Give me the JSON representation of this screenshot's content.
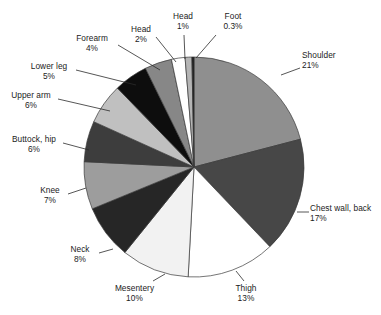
{
  "chart_data": {
    "type": "pie",
    "title": "",
    "subtitle": "",
    "xlabel": "",
    "ylabel": "",
    "legend_position": "none",
    "grid": false,
    "value_unit": "%",
    "start_angle_deg": 0,
    "direction": "clockwise",
    "categories": [
      "Shoulder",
      "Chest wall, back",
      "Thigh",
      "Mesentery",
      "Neck",
      "Knee",
      "Buttock, hip",
      "Upper arm",
      "Lower leg",
      "Forearm",
      "Head",
      "Head",
      "Foot"
    ],
    "values": [
      21,
      17,
      13,
      10,
      8,
      7,
      6,
      6,
      5,
      4,
      2,
      1,
      0.3
    ],
    "value_labels": [
      "21%",
      "17%",
      "13%",
      "10%",
      "8%",
      "7%",
      "6%",
      "6%",
      "5%",
      "4%",
      "2%",
      "1%",
      "0.3%"
    ],
    "colors": [
      "#8f8f8f",
      "#474747",
      "#ffffff",
      "#f2f2f2",
      "#262626",
      "#9d9d9d",
      "#3d3d3d",
      "#c0c0c0",
      "#0d0d0d",
      "#878787",
      "#ffffff",
      "#b5b5b5",
      "#1a1a1a"
    ],
    "slices": [
      {
        "label": "Shoulder",
        "value": 21,
        "value_label": "21%",
        "color": "#8f8f8f"
      },
      {
        "label": "Chest wall, back",
        "value": 17,
        "value_label": "17%",
        "color": "#474747"
      },
      {
        "label": "Thigh",
        "value": 13,
        "value_label": "13%",
        "color": "#ffffff"
      },
      {
        "label": "Mesentery",
        "value": 10,
        "value_label": "10%",
        "color": "#f2f2f2"
      },
      {
        "label": "Neck",
        "value": 8,
        "value_label": "8%",
        "color": "#262626"
      },
      {
        "label": "Knee",
        "value": 7,
        "value_label": "7%",
        "color": "#9d9d9d"
      },
      {
        "label": "Buttock, hip",
        "value": 6,
        "value_label": "6%",
        "color": "#3d3d3d"
      },
      {
        "label": "Upper arm",
        "value": 6,
        "value_label": "6%",
        "color": "#c0c0c0"
      },
      {
        "label": "Lower leg",
        "value": 5,
        "value_label": "5%",
        "color": "#0d0d0d"
      },
      {
        "label": "Forearm",
        "value": 4,
        "value_label": "4%",
        "color": "#878787"
      },
      {
        "label": "Head",
        "value": 2,
        "value_label": "2%",
        "color": "#ffffff"
      },
      {
        "label": "Head",
        "value": 1,
        "value_label": "1%",
        "color": "#b5b5b5"
      },
      {
        "label": "Foot",
        "value": 0.3,
        "value_label": "0.3%",
        "color": "#1a1a1a"
      }
    ]
  },
  "labels": {
    "shoulder": {
      "name": "Shoulder",
      "percent": "21%"
    },
    "chest": {
      "name": "Chest wall, back",
      "percent": "17%"
    },
    "thigh": {
      "name": "Thigh",
      "percent": "13%"
    },
    "mesentery": {
      "name": "Mesentery",
      "percent": "10%"
    },
    "neck": {
      "name": "Neck",
      "percent": "8%"
    },
    "knee": {
      "name": "Knee",
      "percent": "7%"
    },
    "buttock": {
      "name": "Buttock, hip",
      "percent": "6%"
    },
    "upperarm": {
      "name": "Upper arm",
      "percent": "6%"
    },
    "lowerleg": {
      "name": "Lower leg",
      "percent": "5%"
    },
    "forearm": {
      "name": "Forearm",
      "percent": "4%"
    },
    "head2": {
      "name": "Head",
      "percent": "2%"
    },
    "head1": {
      "name": "Head",
      "percent": "1%"
    },
    "foot": {
      "name": "Foot",
      "percent": "0.3%"
    }
  }
}
